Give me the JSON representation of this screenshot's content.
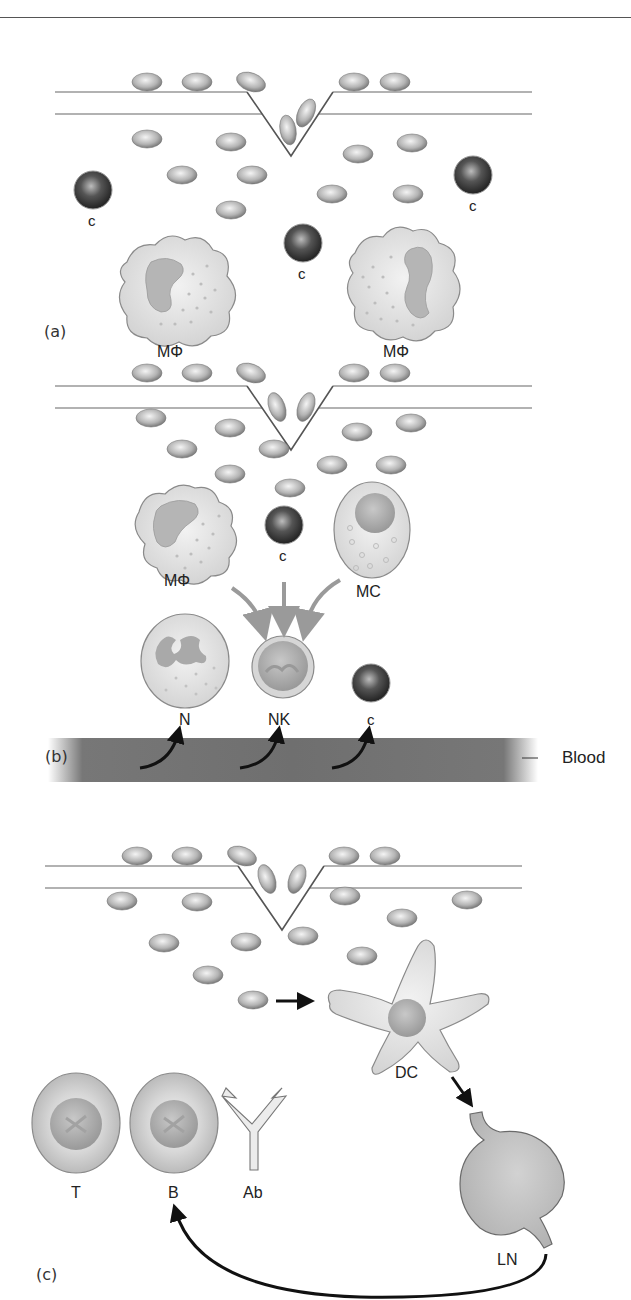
{
  "figure": {
    "colors": {
      "epithelium_line": "#666666",
      "microbe_light": "#e6e6e6",
      "microbe_dark": "#6a6a6a",
      "complement_dark": "#333333",
      "cell_fill": "#dddddd",
      "cell_stroke": "#777777",
      "nucleus": "#a8a8a8",
      "grey_arrow": "#9a9a9a",
      "black_arrow": "#111111",
      "blood": "#6f6f6f",
      "lymph_node": "#bdbdbd"
    }
  },
  "panels": [
    {
      "id": "a",
      "label": "(a)",
      "epithelium": {
        "y1": 92,
        "y2": 114,
        "x_start": 55,
        "x_end": 532,
        "notch": [
          [
            247,
            92
          ],
          [
            291,
            156
          ],
          [
            333,
            92
          ]
        ]
      },
      "microbes": [
        {
          "cx": 147,
          "cy": 82,
          "rx": 15,
          "ry": 9,
          "rot": 0
        },
        {
          "cx": 197,
          "cy": 82,
          "rx": 15,
          "ry": 9,
          "rot": 0
        },
        {
          "cx": 251,
          "cy": 82,
          "rx": 15,
          "ry": 9,
          "rot": 20
        },
        {
          "cx": 354,
          "cy": 82,
          "rx": 15,
          "ry": 9,
          "rot": 0
        },
        {
          "cx": 395,
          "cy": 82,
          "rx": 15,
          "ry": 9,
          "rot": 0
        },
        {
          "cx": 306,
          "cy": 113,
          "rx": 8,
          "ry": 15,
          "rot": 25
        },
        {
          "cx": 288,
          "cy": 130,
          "rx": 8,
          "ry": 15,
          "rot": -10
        },
        {
          "cx": 147,
          "cy": 139,
          "rx": 15,
          "ry": 9,
          "rot": 0
        },
        {
          "cx": 231,
          "cy": 142,
          "rx": 15,
          "ry": 9,
          "rot": 0
        },
        {
          "cx": 182,
          "cy": 175,
          "rx": 15,
          "ry": 9,
          "rot": 0
        },
        {
          "cx": 252,
          "cy": 175,
          "rx": 15,
          "ry": 9,
          "rot": 0
        },
        {
          "cx": 231,
          "cy": 210,
          "rx": 15,
          "ry": 9,
          "rot": 0
        },
        {
          "cx": 358,
          "cy": 154,
          "rx": 15,
          "ry": 9,
          "rot": 0
        },
        {
          "cx": 412,
          "cy": 143,
          "rx": 15,
          "ry": 9,
          "rot": 0
        },
        {
          "cx": 332,
          "cy": 194,
          "rx": 15,
          "ry": 9,
          "rot": 0
        },
        {
          "cx": 408,
          "cy": 194,
          "rx": 15,
          "ry": 9,
          "rot": 0
        }
      ],
      "complement": [
        {
          "cx": 93,
          "cy": 190,
          "r": 19,
          "label": "c",
          "lx": 88,
          "ly": 213
        },
        {
          "cx": 303,
          "cy": 243,
          "r": 19,
          "label": "c",
          "lx": 298,
          "ly": 266
        },
        {
          "cx": 473,
          "cy": 175,
          "r": 19,
          "label": "c",
          "lx": 469,
          "ly": 198
        }
      ],
      "macrophages": [
        {
          "cx": 177,
          "cy": 290,
          "label": "MΦ",
          "lx": 157,
          "ly": 344
        },
        {
          "cx": 403,
          "cy": 283,
          "label": "MΦ",
          "lx": 383,
          "ly": 344
        }
      ]
    },
    {
      "id": "b",
      "label": "(b)",
      "epithelium": {
        "y1": 386,
        "y2": 408,
        "x_start": 55,
        "x_end": 532,
        "notch": [
          [
            247,
            386
          ],
          [
            291,
            450
          ],
          [
            333,
            386
          ]
        ]
      },
      "microbes": [
        {
          "cx": 147,
          "cy": 373,
          "rx": 15,
          "ry": 9,
          "rot": 0
        },
        {
          "cx": 197,
          "cy": 373,
          "rx": 15,
          "ry": 9,
          "rot": 0
        },
        {
          "cx": 251,
          "cy": 373,
          "rx": 15,
          "ry": 9,
          "rot": 20
        },
        {
          "cx": 354,
          "cy": 373,
          "rx": 15,
          "ry": 9,
          "rot": 0
        },
        {
          "cx": 395,
          "cy": 373,
          "rx": 15,
          "ry": 9,
          "rot": 0
        },
        {
          "cx": 277,
          "cy": 407,
          "rx": 8,
          "ry": 15,
          "rot": -20
        },
        {
          "cx": 306,
          "cy": 407,
          "rx": 8,
          "ry": 15,
          "rot": 20
        },
        {
          "cx": 151,
          "cy": 418,
          "rx": 15,
          "ry": 9,
          "rot": 0
        },
        {
          "cx": 230,
          "cy": 428,
          "rx": 15,
          "ry": 9,
          "rot": 0
        },
        {
          "cx": 182,
          "cy": 449,
          "rx": 15,
          "ry": 9,
          "rot": 0
        },
        {
          "cx": 274,
          "cy": 449,
          "rx": 15,
          "ry": 9,
          "rot": 0
        },
        {
          "cx": 230,
          "cy": 474,
          "rx": 15,
          "ry": 9,
          "rot": 0
        },
        {
          "cx": 357,
          "cy": 432,
          "rx": 15,
          "ry": 9,
          "rot": 0
        },
        {
          "cx": 411,
          "cy": 423,
          "rx": 15,
          "ry": 9,
          "rot": 0
        },
        {
          "cx": 332,
          "cy": 465,
          "rx": 15,
          "ry": 9,
          "rot": 0
        },
        {
          "cx": 391,
          "cy": 465,
          "rx": 15,
          "ry": 9,
          "rot": 0
        },
        {
          "cx": 290,
          "cy": 488,
          "rx": 15,
          "ry": 9,
          "rot": 0
        }
      ],
      "complement": [
        {
          "cx": 284,
          "cy": 525,
          "r": 19,
          "label": "c",
          "lx": 279,
          "ly": 548
        },
        {
          "cx": 371,
          "cy": 683,
          "r": 19,
          "label": "c",
          "lx": 367,
          "ly": 712
        }
      ],
      "macrophage": {
        "cx": 185,
        "cy": 530,
        "label": "MΦ",
        "lx": 164,
        "ly": 573
      },
      "mast_cell": {
        "cx": 372,
        "cy": 530,
        "rx": 38,
        "ry": 48,
        "label": "MC",
        "lx": 356,
        "ly": 584
      },
      "neutrophil": {
        "cx": 185,
        "cy": 661,
        "rx": 44,
        "ry": 47,
        "label": "N",
        "lx": 179,
        "ly": 712
      },
      "nk_cell": {
        "cx": 283,
        "cy": 667,
        "r": 31,
        "label": "NK",
        "lx": 268,
        "ly": 712
      },
      "blood_label": "Blood"
    },
    {
      "id": "c",
      "label": "(c)",
      "epithelium": {
        "y1": 866,
        "y2": 888,
        "x_start": 45,
        "x_end": 522,
        "notch": [
          [
            238,
            866
          ],
          [
            282,
            930
          ],
          [
            324,
            866
          ]
        ]
      },
      "microbes": [
        {
          "cx": 137,
          "cy": 856,
          "rx": 15,
          "ry": 9,
          "rot": 0
        },
        {
          "cx": 187,
          "cy": 856,
          "rx": 15,
          "ry": 9,
          "rot": 0
        },
        {
          "cx": 242,
          "cy": 856,
          "rx": 15,
          "ry": 9,
          "rot": 20
        },
        {
          "cx": 344,
          "cy": 856,
          "rx": 15,
          "ry": 9,
          "rot": 0
        },
        {
          "cx": 385,
          "cy": 856,
          "rx": 15,
          "ry": 9,
          "rot": 0
        },
        {
          "cx": 267,
          "cy": 879,
          "rx": 8,
          "ry": 15,
          "rot": -20
        },
        {
          "cx": 297,
          "cy": 879,
          "rx": 8,
          "ry": 15,
          "rot": 20
        },
        {
          "cx": 122,
          "cy": 901,
          "rx": 15,
          "ry": 9,
          "rot": 0
        },
        {
          "cx": 197,
          "cy": 902,
          "rx": 15,
          "ry": 9,
          "rot": 0
        },
        {
          "cx": 345,
          "cy": 896,
          "rx": 15,
          "ry": 9,
          "rot": 0
        },
        {
          "cx": 467,
          "cy": 900,
          "rx": 15,
          "ry": 9,
          "rot": 0
        },
        {
          "cx": 402,
          "cy": 918,
          "rx": 15,
          "ry": 9,
          "rot": 0
        },
        {
          "cx": 164,
          "cy": 943,
          "rx": 15,
          "ry": 9,
          "rot": 0
        },
        {
          "cx": 246,
          "cy": 942,
          "rx": 15,
          "ry": 9,
          "rot": 0
        },
        {
          "cx": 303,
          "cy": 936,
          "rx": 15,
          "ry": 9,
          "rot": 0
        },
        {
          "cx": 362,
          "cy": 956,
          "rx": 15,
          "ry": 9,
          "rot": 0
        },
        {
          "cx": 208,
          "cy": 975,
          "rx": 15,
          "ry": 9,
          "rot": 0
        },
        {
          "cx": 253,
          "cy": 1000,
          "rx": 15,
          "ry": 9,
          "rot": 0
        }
      ],
      "dendritic_cell": {
        "cx": 405,
        "cy": 1012,
        "label": "DC",
        "lx": 395,
        "ly": 1065
      },
      "t_cell": {
        "cx": 76,
        "cy": 1123,
        "label": "T",
        "lx": 71,
        "ly": 1185
      },
      "b_cell": {
        "cx": 174,
        "cy": 1123,
        "label": "B",
        "lx": 168,
        "ly": 1185
      },
      "antibody": {
        "label": "Ab",
        "lx": 243,
        "ly": 1185
      },
      "lymph_node": {
        "label": "LN",
        "lx": 497,
        "ly": 1252
      }
    }
  ]
}
